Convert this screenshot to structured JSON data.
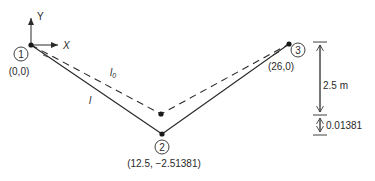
{
  "axes": {
    "y_label": "Y",
    "x_label": "X"
  },
  "nodes": [
    {
      "id": "1",
      "coord_label": "(0,0)"
    },
    {
      "id": "2",
      "coord_label": "(12.5, −2.51381)"
    },
    {
      "id": "3",
      "coord_label": "(26,0)"
    }
  ],
  "members": {
    "undeformed_label": "l",
    "undeformed_subscript": "0",
    "deformed_label": "l"
  },
  "dimensions": {
    "sag_initial": "2.5 m",
    "sag_additional": "0.01381"
  },
  "colors": {
    "line": "#2a2a2a",
    "background": "#ffffff"
  }
}
